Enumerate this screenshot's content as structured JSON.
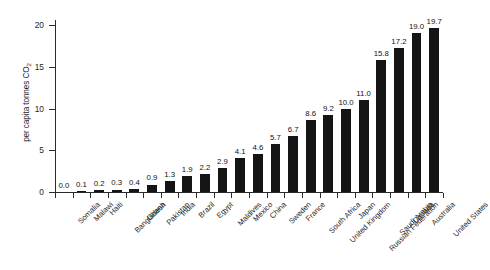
{
  "chart_data": {
    "type": "bar",
    "title": "",
    "subtitle": "",
    "xlabel": "",
    "ylabel": "per capita tonnes CO2",
    "ylabel_prefix": "per capita tonnes CO",
    "ylabel_subscript": "2",
    "ylim": [
      0,
      20.6
    ],
    "ytick_values": [
      0,
      5,
      10,
      15,
      20
    ],
    "ytick_labels": [
      "0",
      "5",
      "10",
      "15",
      "20"
    ],
    "grid": false,
    "legend": "none",
    "bar_color": "#141414",
    "axis_color": "#2b2b2b",
    "value_label_format": "one-decimal",
    "categories": [
      "Somalia",
      "Malawi",
      "Haiti",
      "Bangladesh",
      "Ghana",
      "Pakistan",
      "India",
      "Brazil",
      "Egypt",
      "Maldives",
      "Mexico",
      "China",
      "Sweden",
      "France",
      "South Africa",
      "United Kingdom",
      "Japan",
      "Russian Federation",
      "Saudi Arabia",
      "Canada",
      "Australia",
      "United States"
    ],
    "values": [
      0.0,
      0.1,
      0.2,
      0.3,
      0.4,
      0.9,
      1.3,
      1.9,
      2.2,
      2.9,
      4.1,
      4.6,
      5.7,
      6.7,
      8.6,
      9.2,
      10.0,
      11.0,
      15.8,
      17.2,
      19.0,
      19.7
    ],
    "value_labels": [
      "0.0",
      "0.1",
      "0.2",
      "0.3",
      "0.4",
      "0.9",
      "1.3",
      "1.9",
      "2.2",
      "2.9",
      "4.1",
      "4.6",
      "5.7",
      "6.7",
      "8.6",
      "9.2",
      "10.0",
      "11.0",
      "15.8",
      "17.2",
      "19.0",
      "19.7"
    ]
  }
}
